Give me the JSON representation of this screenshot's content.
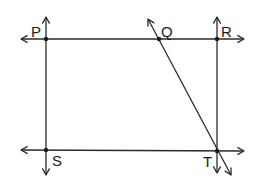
{
  "diagram": {
    "title": "",
    "stroke_color": "#2a2a2a",
    "background": "#ffffff",
    "points": [
      {
        "id": "P",
        "label": "P",
        "x": 46,
        "y": 39,
        "label_x": 31,
        "label_y": 37
      },
      {
        "id": "Q",
        "label": "Q",
        "x": 159,
        "y": 39,
        "label_x": 161,
        "label_y": 37
      },
      {
        "id": "R",
        "label": "R",
        "x": 217,
        "y": 39,
        "label_x": 221,
        "label_y": 37
      },
      {
        "id": "S",
        "label": "S",
        "x": 46,
        "y": 150,
        "label_x": 52,
        "label_y": 166
      },
      {
        "id": "T",
        "label": "T",
        "x": 217,
        "y": 151,
        "label_x": 203,
        "label_y": 167
      }
    ],
    "lines": [
      {
        "id": "line-PR",
        "description": "horizontal line through P, Q, R",
        "x1": 21,
        "y1": 39,
        "x2": 244,
        "y2": 39,
        "arrows": [
          "start",
          "end"
        ]
      },
      {
        "id": "line-ST",
        "description": "horizontal line through S, T",
        "x1": 21,
        "y1": 150,
        "x2": 244,
        "y2": 151,
        "arrows": [
          "start",
          "end"
        ]
      },
      {
        "id": "line-PS",
        "description": "vertical line through P, S",
        "x1": 46,
        "y1": 17,
        "x2": 46,
        "y2": 175,
        "arrows": [
          "start",
          "end"
        ]
      },
      {
        "id": "line-RT",
        "description": "vertical line through R, T",
        "x1": 217,
        "y1": 17,
        "x2": 217,
        "y2": 173,
        "arrows": [
          "start",
          "end"
        ]
      },
      {
        "id": "line-QT",
        "description": "transversal through Q and T",
        "x1": 148,
        "y1": 19,
        "x2": 231,
        "y2": 175,
        "arrows": [
          "start",
          "end"
        ]
      }
    ]
  }
}
